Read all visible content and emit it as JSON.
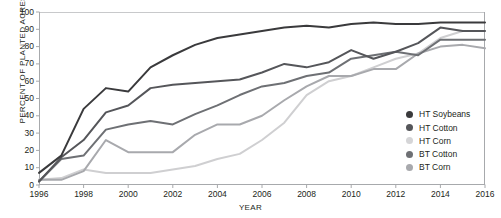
{
  "chart_data": {
    "type": "line",
    "title": "",
    "xlabel": "YEAR",
    "ylabel": "PERCENT OF PLANTED ACRES",
    "xlim": [
      1996,
      2016
    ],
    "ylim": [
      0,
      100
    ],
    "grid": false,
    "legend_position": "inside-right",
    "x": [
      1996,
      1997,
      1998,
      1999,
      2000,
      2001,
      2002,
      2003,
      2004,
      2005,
      2006,
      2007,
      2008,
      2009,
      2010,
      2011,
      2012,
      2013,
      2014,
      2015,
      2016
    ],
    "xticks": [
      1996,
      1998,
      2000,
      2002,
      2004,
      2006,
      2008,
      2010,
      2012,
      2014,
      2016
    ],
    "yticks": [
      0,
      10,
      20,
      30,
      40,
      50,
      60,
      70,
      80,
      90,
      100
    ],
    "series": [
      {
        "name": "HT Soybeans",
        "color": "#3a3a3c",
        "values": [
          7,
          17,
          44,
          56,
          54,
          68,
          75,
          81,
          85,
          87,
          89,
          91,
          92,
          91,
          93,
          94,
          93,
          93,
          94,
          94,
          94
        ]
      },
      {
        "name": "HT Cotton",
        "color": "#55565a",
        "values": [
          2,
          16,
          26,
          42,
          46,
          56,
          58,
          59,
          60,
          61,
          65,
          70,
          68,
          71,
          78,
          73,
          77,
          82,
          91,
          89,
          89
        ]
      },
      {
        "name": "HT Corn",
        "color": "#cfcfd1",
        "values": [
          3,
          4,
          9,
          7,
          7,
          7,
          9,
          11,
          15,
          18,
          26,
          36,
          52,
          60,
          63,
          68,
          73,
          76,
          85,
          89,
          89
        ]
      },
      {
        "name": "BT Cotton",
        "color": "#6e7074",
        "values": [
          2,
          15,
          17,
          32,
          35,
          37,
          35,
          41,
          46,
          52,
          57,
          59,
          63,
          65,
          73,
          75,
          77,
          75,
          84,
          84,
          84
        ]
      },
      {
        "name": "BT Corn",
        "color": "#a8a9ad",
        "values": [
          3,
          3,
          8,
          26,
          19,
          19,
          19,
          29,
          35,
          35,
          40,
          49,
          57,
          63,
          63,
          67,
          67,
          76,
          80,
          81,
          79
        ]
      }
    ]
  },
  "legend": {
    "items": [
      {
        "label": "HT Soybeans",
        "color": "#3a3a3c"
      },
      {
        "label": "HT Cotton",
        "color": "#55565a"
      },
      {
        "label": "HT Corn",
        "color": "#d5d5d7"
      },
      {
        "label": "BT Cotton",
        "color": "#6e7074"
      },
      {
        "label": "BT Corn",
        "color": "#a8a9ad"
      }
    ]
  },
  "axes": {
    "axis_color": "#a7a9ac",
    "top_rule_color": "#c8c9cb"
  }
}
